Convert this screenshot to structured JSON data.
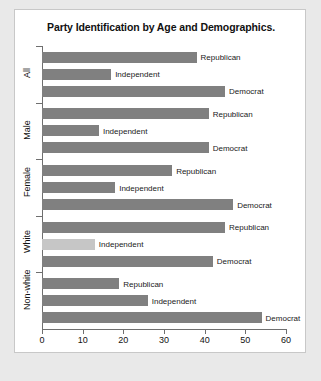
{
  "chart_data": {
    "type": "bar",
    "orientation": "horizontal",
    "title": "Party Identification by Age and Demographics.",
    "xlabel": "",
    "ylabel": "",
    "xlim": [
      0,
      60
    ],
    "xticks": [
      0,
      10,
      20,
      30,
      40,
      50,
      60
    ],
    "grid": false,
    "legend": false,
    "categories": [
      "All",
      "Male",
      "Female",
      "White",
      "Non-white"
    ],
    "series": [
      {
        "name": "Republican",
        "values": [
          38,
          41,
          32,
          45,
          19
        ]
      },
      {
        "name": "Independent",
        "values": [
          17,
          14,
          18,
          13,
          26
        ]
      },
      {
        "name": "Democrat",
        "values": [
          45,
          41,
          47,
          42,
          54
        ]
      }
    ],
    "groups": [
      {
        "label": "All",
        "bars": [
          {
            "label": "Republican",
            "value": 38,
            "shade": "dark"
          },
          {
            "label": "Independent",
            "value": 17,
            "shade": "dark"
          },
          {
            "label": "Democrat",
            "value": 45,
            "shade": "dark"
          }
        ]
      },
      {
        "label": "Male",
        "bars": [
          {
            "label": "Republican",
            "value": 41,
            "shade": "dark"
          },
          {
            "label": "Independent",
            "value": 14,
            "shade": "dark"
          },
          {
            "label": "Democrat",
            "value": 41,
            "shade": "dark"
          }
        ]
      },
      {
        "label": "Female",
        "bars": [
          {
            "label": "Republican",
            "value": 32,
            "shade": "dark"
          },
          {
            "label": "Independent",
            "value": 18,
            "shade": "dark"
          },
          {
            "label": "Democrat",
            "value": 47,
            "shade": "dark"
          }
        ]
      },
      {
        "label": "White",
        "bars": [
          {
            "label": "Republican",
            "value": 45,
            "shade": "dark"
          },
          {
            "label": "Independent",
            "value": 13,
            "shade": "light"
          },
          {
            "label": "Democrat",
            "value": 42,
            "shade": "dark"
          }
        ]
      },
      {
        "label": "Non-white",
        "bars": [
          {
            "label": "Republican",
            "value": 19,
            "shade": "dark"
          },
          {
            "label": "Independent",
            "value": 26,
            "shade": "dark"
          },
          {
            "label": "Democrat",
            "value": 54,
            "shade": "dark"
          }
        ]
      }
    ],
    "colors": {
      "bar": "#808080",
      "bar_light": "#c6c6c6",
      "axis": "#6f6f6f",
      "text": "#111111",
      "panel": "#ffffff",
      "page": "#e9e9e9"
    }
  }
}
